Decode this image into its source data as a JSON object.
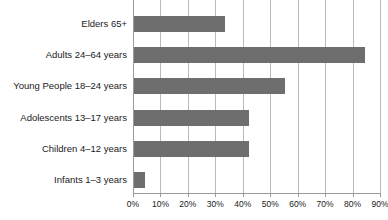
{
  "chart_data": {
    "type": "bar",
    "orientation": "horizontal",
    "title": "",
    "subtitle": "",
    "xlabel": "",
    "ylabel": "",
    "xlim": [
      0,
      90
    ],
    "grid": true,
    "legend": false,
    "legend_position": "none",
    "bar_color": "#6e6e6e",
    "gridline_color": "#b9b9b9",
    "axis_color": "#9a9a9a",
    "text_color": "#1a1a1a",
    "categories": [
      "Elders 65+",
      "Adults 24–64 years",
      "Young People 18–24 years",
      "Adolescents 13–17 years",
      "Children 4–12 years",
      "Infants 1–3 years"
    ],
    "values": [
      33,
      84,
      55,
      42,
      42,
      4
    ],
    "value_unit": "%",
    "xticks": [
      0,
      10,
      20,
      30,
      40,
      50,
      60,
      70,
      80,
      90
    ],
    "xtick_labels": [
      "0%",
      "10%",
      "20%",
      "30%",
      "40%",
      "50%",
      "60%",
      "70%",
      "80%",
      "90%"
    ]
  }
}
